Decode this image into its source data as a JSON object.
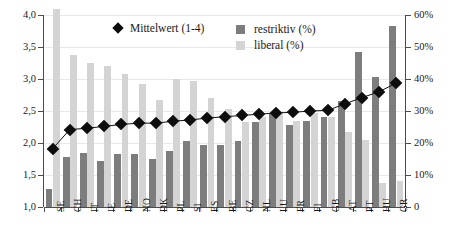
{
  "chart_data": {
    "type": "bar",
    "title": "",
    "subtitle": "",
    "xlabel": "",
    "ylabel": "",
    "y2label": "",
    "grid": true,
    "legend_position": "top",
    "categories": [
      "SE",
      "CH",
      "IT",
      "IE",
      "DE",
      "NO",
      "DK",
      "PL",
      "SI",
      "ES",
      "BE",
      "CZ",
      "NL",
      "LU",
      "FR",
      "FI",
      "GB",
      "AT",
      "PT",
      "HU",
      "GR"
    ],
    "left_axis": {
      "ticks": [
        "1,0",
        "1,5",
        "2,0",
        "2,5",
        "3,0",
        "3,5",
        "4,0"
      ],
      "tick_values": [
        1.0,
        1.5,
        2.0,
        2.5,
        3.0,
        3.5,
        4.0
      ],
      "ylim": [
        1.0,
        4.0
      ]
    },
    "right_axis": {
      "ticks": [
        "0",
        "10%",
        "20%",
        "30%",
        "40%",
        "50%",
        "60%"
      ],
      "tick_values": [
        0,
        10,
        20,
        30,
        40,
        50,
        60
      ],
      "ylim": [
        0,
        60
      ]
    },
    "series": [
      {
        "name": "restriktiv (%)",
        "key": "restriktiv",
        "axis": "right",
        "color": "#7d7d7d",
        "values": [
          5.5,
          15.5,
          17.0,
          14.5,
          16.5,
          16.5,
          15.0,
          17.5,
          20.5,
          19.5,
          19.5,
          20.5,
          26.5,
          29.5,
          25.5,
          27.0,
          28.0,
          33.0,
          48.5,
          40.5,
          56.5
        ]
      },
      {
        "name": "liberal (%)",
        "key": "liberal",
        "axis": "right",
        "color": "#d4d4d4",
        "values": [
          62.0,
          47.5,
          45.0,
          44.0,
          41.5,
          38.5,
          33.5,
          40.0,
          39.5,
          34.0,
          30.5,
          26.5,
          28.0,
          29.5,
          27.0,
          29.5,
          28.0,
          23.5,
          21.0,
          7.5,
          8.0
        ]
      },
      {
        "name": "Mittelwert (1-4)",
        "key": "mittelwert",
        "axis": "left",
        "color": "#0d0d0d",
        "values": [
          1.91,
          2.21,
          2.23,
          2.26,
          2.29,
          2.31,
          2.31,
          2.34,
          2.36,
          2.39,
          2.41,
          2.43,
          2.45,
          2.47,
          2.48,
          2.5,
          2.51,
          2.61,
          2.71,
          2.8,
          2.94
        ]
      }
    ]
  },
  "legend": {
    "mean_label": "Mittelwert (1-4)",
    "restriktiv_label": "restriktiv (%)",
    "liberal_label": "liberal (%)"
  }
}
